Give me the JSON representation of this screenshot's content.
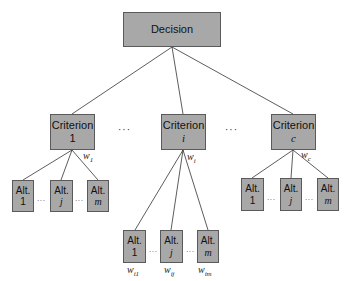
{
  "diagram": {
    "type": "hierarchy",
    "colors": {
      "box_fill": "#a8a8a8",
      "box_border": "#5a5a5a",
      "line": "#333333"
    },
    "root": {
      "label": "Decision"
    },
    "criteria": [
      {
        "label": "Criterion",
        "index": "1",
        "weight": "w",
        "weight_sub": "1"
      },
      {
        "label": "Criterion",
        "index": "i",
        "weight": "w",
        "weight_sub": "i"
      },
      {
        "label": "Criterion",
        "index": "c",
        "weight": "w",
        "weight_sub": "c"
      }
    ],
    "criteria_ellipsis": "···",
    "alternatives": {
      "left": [
        {
          "label": "Alt.",
          "index": "1"
        },
        {
          "label": "Alt.",
          "index": "j"
        },
        {
          "label": "Alt.",
          "index": "m"
        }
      ],
      "middle": [
        {
          "label": "Alt.",
          "index": "1",
          "weight": "w",
          "weight_sub": "i1"
        },
        {
          "label": "Alt.",
          "index": "j",
          "weight": "w",
          "weight_sub": "ij"
        },
        {
          "label": "Alt.",
          "index": "m",
          "weight": "w",
          "weight_sub": "im"
        }
      ],
      "right": [
        {
          "label": "Alt.",
          "index": "1"
        },
        {
          "label": "Alt.",
          "index": "j"
        },
        {
          "label": "Alt.",
          "index": "m"
        }
      ]
    },
    "alt_ellipsis": "···"
  }
}
